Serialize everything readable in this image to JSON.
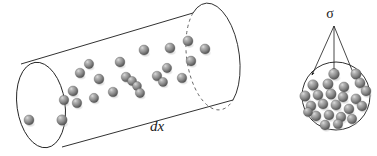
{
  "figure": {
    "name": "collision-cylinder-diagram",
    "background_color": "#ffffff",
    "width": 377,
    "height": 156
  },
  "labels": {
    "length_label": "dx",
    "cross_section_label": "σ"
  },
  "style": {
    "outline_color": "#1a1a1a",
    "dashed_color": "#555555",
    "sphere_mid": "#808080",
    "sphere_highlight": "#c4c4c4",
    "sphere_shadow": "#4a4a4a",
    "arrow_color": "#1a1a1a"
  },
  "cylinder": {
    "name": "collision-cylinder",
    "left_cap": {
      "cx": 41,
      "cy": 105,
      "rx": 24,
      "ry": 43,
      "rotation": -8
    },
    "right_cap": {
      "cx": 213,
      "cy": 58,
      "rx": 23,
      "ry": 47,
      "rotation": -8
    },
    "top_edge": {
      "x1": 21,
      "y1": 64,
      "x2": 193,
      "y2": 13
    },
    "bottom_edge": {
      "x1": 62,
      "y1": 147,
      "x2": 233,
      "y2": 100
    },
    "spheres": [
      {
        "cx": 29,
        "cy": 120,
        "r": 5.0
      },
      {
        "cx": 62,
        "cy": 120,
        "r": 5.2
      },
      {
        "cx": 64,
        "cy": 100,
        "r": 4.8
      },
      {
        "cx": 73,
        "cy": 91,
        "r": 5.0
      },
      {
        "cx": 80,
        "cy": 73,
        "r": 4.8
      },
      {
        "cx": 77,
        "cy": 103,
        "r": 4.8
      },
      {
        "cx": 89,
        "cy": 64,
        "r": 4.7
      },
      {
        "cx": 94,
        "cy": 98,
        "r": 4.7
      },
      {
        "cx": 99,
        "cy": 79,
        "r": 4.9
      },
      {
        "cx": 113,
        "cy": 92,
        "r": 4.8
      },
      {
        "cx": 120,
        "cy": 62,
        "r": 4.9
      },
      {
        "cx": 126,
        "cy": 77,
        "r": 4.8
      },
      {
        "cx": 132,
        "cy": 81,
        "r": 4.6
      },
      {
        "cx": 137,
        "cy": 86,
        "r": 4.5
      },
      {
        "cx": 144,
        "cy": 50,
        "r": 5.0
      },
      {
        "cx": 140,
        "cy": 93,
        "r": 4.7
      },
      {
        "cx": 157,
        "cy": 76,
        "r": 4.8
      },
      {
        "cx": 163,
        "cy": 82,
        "r": 4.6
      },
      {
        "cx": 170,
        "cy": 48,
        "r": 5.0
      },
      {
        "cx": 167,
        "cy": 68,
        "r": 4.7
      },
      {
        "cx": 182,
        "cy": 78,
        "r": 4.8
      },
      {
        "cx": 188,
        "cy": 41,
        "r": 5.0
      },
      {
        "cx": 191,
        "cy": 61,
        "r": 4.9
      },
      {
        "cx": 205,
        "cy": 49,
        "r": 5.0
      }
    ]
  },
  "cross_section": {
    "name": "cross-section-circle",
    "circle": {
      "cx": 336,
      "cy": 96,
      "r": 34
    },
    "apex": {
      "x": 334,
      "y": 26
    },
    "arrows": [
      {
        "x": 312,
        "y": 75
      },
      {
        "x": 334,
        "y": 71
      },
      {
        "x": 354,
        "y": 75
      }
    ],
    "spheres": [
      {
        "cx": 334,
        "cy": 74,
        "r": 5.4
      },
      {
        "cx": 356,
        "cy": 74,
        "r": 5.2
      },
      {
        "cx": 313,
        "cy": 85,
        "r": 5.3
      },
      {
        "cx": 328,
        "cy": 84,
        "r": 5.2
      },
      {
        "cx": 344,
        "cy": 87,
        "r": 5.0
      },
      {
        "cx": 360,
        "cy": 83,
        "r": 5.1
      },
      {
        "cx": 366,
        "cy": 91,
        "r": 5.0
      },
      {
        "cx": 305,
        "cy": 96,
        "r": 5.2
      },
      {
        "cx": 318,
        "cy": 95,
        "r": 5.0
      },
      {
        "cx": 331,
        "cy": 94,
        "r": 5.2
      },
      {
        "cx": 343,
        "cy": 97,
        "r": 5.0
      },
      {
        "cx": 356,
        "cy": 99,
        "r": 5.1
      },
      {
        "cx": 311,
        "cy": 106,
        "r": 5.0
      },
      {
        "cx": 323,
        "cy": 104,
        "r": 5.0
      },
      {
        "cx": 336,
        "cy": 105,
        "r": 5.1
      },
      {
        "cx": 349,
        "cy": 109,
        "r": 5.0
      },
      {
        "cx": 362,
        "cy": 106,
        "r": 4.9
      },
      {
        "cx": 316,
        "cy": 116,
        "r": 5.0
      },
      {
        "cx": 329,
        "cy": 115,
        "r": 5.0
      },
      {
        "cx": 341,
        "cy": 117,
        "r": 4.9
      },
      {
        "cx": 352,
        "cy": 119,
        "r": 4.8
      },
      {
        "cx": 325,
        "cy": 125,
        "r": 4.9
      },
      {
        "cx": 338,
        "cy": 124,
        "r": 4.8
      },
      {
        "cx": 308,
        "cy": 112,
        "r": 4.6
      }
    ]
  }
}
